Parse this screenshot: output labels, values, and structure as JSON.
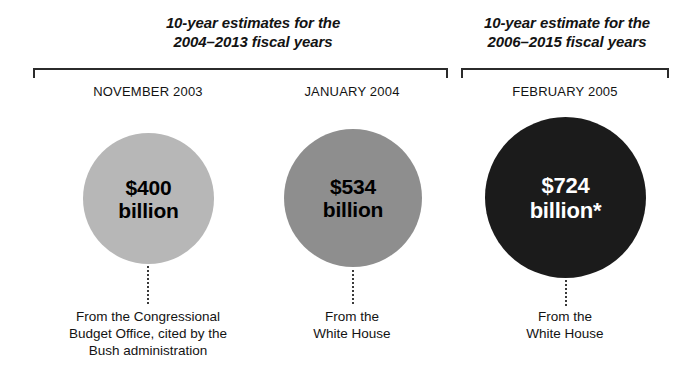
{
  "chart_data": {
    "type": "bar",
    "xlabel": "",
    "ylabel": "Estimate (billions of dollars)",
    "categories": [
      "NOVEMBER 2003",
      "JANUARY 2004",
      "FEBRUARY 2005"
    ],
    "values": [
      400,
      534,
      724
    ],
    "value_labels": [
      "$400 billion",
      "$534 billion",
      "$724 billion*"
    ],
    "unit": "billion dollars",
    "encoding": "proportional circle area",
    "series": [
      {
        "name": "10-year cost estimate",
        "values": [
          400,
          534,
          724
        ]
      }
    ],
    "annotations": [
      "From the Congressional Budget Office, cited by the Bush administration",
      "From the White House",
      "From the White House"
    ],
    "group_headings": [
      "10-year estimates for the 2004–2013 fiscal years",
      "10-year estimate for the 2006–2015 fiscal years"
    ],
    "legend": [],
    "grid": false
  },
  "groups": [
    {
      "heading_line1": "10-year estimates for the",
      "heading_line2": "2004–2013 fiscal years"
    },
    {
      "heading_line1": "10-year estimate for the",
      "heading_line2": "2006–2015 fiscal years"
    }
  ],
  "items": [
    {
      "date": "NOVEMBER 2003",
      "amount": "$400",
      "unit": "billion",
      "circle_color": "#b7b7b7",
      "text_color": "#000000",
      "source_line1": "From the Congressional",
      "source_line2": "Budget Office, cited by the",
      "source_line3": "Bush administration"
    },
    {
      "date": "JANUARY 2004",
      "amount": "$534",
      "unit": "billion",
      "circle_color": "#8e8e8e",
      "text_color": "#000000",
      "source_line1": "From the",
      "source_line2": "White House",
      "source_line3": ""
    },
    {
      "date": "FEBRUARY 2005",
      "amount": "$724",
      "unit": "billion*",
      "circle_color": "#1b1b1b",
      "text_color": "#ffffff",
      "source_line1": "From the",
      "source_line2": "White House",
      "source_line3": ""
    }
  ],
  "colors": {
    "background": "#ffffff",
    "ink": "#131313",
    "bracket": "#2b2b2b",
    "leader": "#3a3a3a"
  }
}
